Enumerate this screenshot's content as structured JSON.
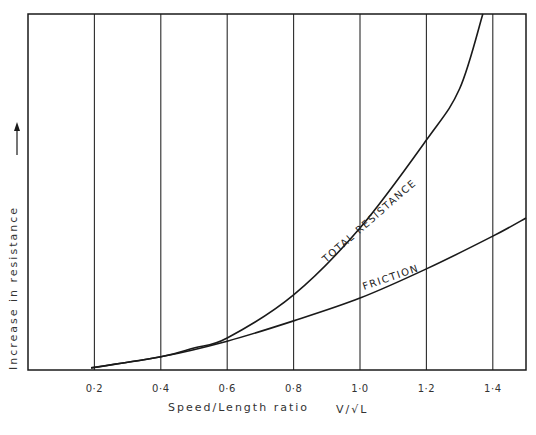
{
  "chart_data": {
    "type": "line",
    "title": "",
    "xlabel": "Speed/Length ratio",
    "xlabel_formula": "V/√L",
    "ylabel": "Increase in resistance",
    "ylabel_arrow": "↑",
    "xlim": [
      0,
      1.5
    ],
    "ylim": [
      0,
      100
    ],
    "x_ticks": [
      0.2,
      0.4,
      0.6,
      0.8,
      1.0,
      1.2,
      1.4
    ],
    "x_tick_labels": [
      "0·2",
      "0·4",
      "0·6",
      "0·8",
      "1·0",
      "1·2",
      "1·4"
    ],
    "grid": "vertical",
    "legend": "none",
    "series": [
      {
        "name": "FRICTION",
        "x": [
          0.19,
          0.4,
          0.6,
          0.8,
          1.0,
          1.2,
          1.4,
          1.5
        ],
        "values": [
          0.6,
          3.7,
          8.1,
          13.8,
          20.2,
          28.4,
          37.6,
          42.7
        ]
      },
      {
        "name": "TOTAL RESISTANCE",
        "x": [
          0.19,
          0.4,
          0.5,
          0.6,
          0.8,
          1.0,
          1.2,
          1.3,
          1.37
        ],
        "values": [
          0.6,
          3.7,
          6.2,
          9.0,
          21.1,
          39.9,
          64.6,
          79.0,
          100
        ]
      }
    ],
    "annotations": [
      {
        "text": "TOTAL RESISTANCE",
        "series": "TOTAL RESISTANCE"
      },
      {
        "text": "FRICTION",
        "series": "FRICTION"
      }
    ],
    "colors": {
      "line": "#1a1a1a",
      "grid": "#2a2a2a",
      "text": "#333333"
    }
  }
}
